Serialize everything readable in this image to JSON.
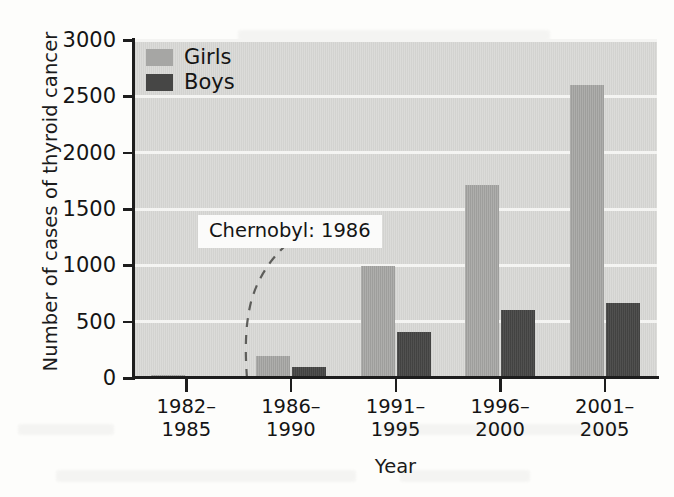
{
  "chart_data": {
    "type": "bar",
    "title": "",
    "xlabel": "Year",
    "ylabel": "Number of cases of thyroid cancer",
    "categories": [
      "1982–1985",
      "1986–1990",
      "1991–1995",
      "1996–2000",
      "2001–2005"
    ],
    "category_lines": [
      [
        "1982–",
        "1985"
      ],
      [
        "1986–",
        "1990"
      ],
      [
        "1991–",
        "1995"
      ],
      [
        "1996–",
        "2000"
      ],
      [
        "2001–",
        "2005"
      ]
    ],
    "series": [
      {
        "name": "Girls",
        "color": "#a6a6a4",
        "values": [
          30,
          195,
          990,
          1710,
          2600
        ]
      },
      {
        "name": "Boys",
        "color": "#464645",
        "values": [
          20,
          95,
          405,
          605,
          670
        ]
      }
    ],
    "ylim": [
      0,
      3000
    ],
    "yticks": [
      0,
      500,
      1000,
      1500,
      2000,
      2500,
      3000
    ],
    "ytick_labels": [
      "0",
      "500",
      "1000",
      "1500",
      "2000",
      "2500",
      "3000"
    ],
    "grid": "horizontal-white-gridlines",
    "legend_position": "top-left-inside",
    "annotations": [
      {
        "text": "Chernobyl: 1986",
        "kind": "label-box-with-dashed-curve"
      }
    ]
  },
  "legend": {
    "items": [
      {
        "label": "Girls",
        "swatch": "girls-swatch"
      },
      {
        "label": "Boys",
        "swatch": "boys-swatch"
      }
    ]
  },
  "annotation": {
    "chernobyl_label": "Chernobyl: 1986"
  }
}
